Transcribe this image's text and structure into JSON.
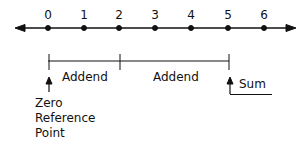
{
  "diagram": {
    "type": "number-line-addition",
    "ticks": [
      "0",
      "1",
      "2",
      "3",
      "4",
      "5",
      "6"
    ],
    "addend_1_label": "Addend",
    "addend_2_label": "Addend",
    "sum_label": "Sum",
    "zero_reference_lines": [
      "Zero",
      "Reference",
      "Point"
    ],
    "addend_1_range": [
      0,
      2
    ],
    "addend_2_range": [
      2,
      5
    ],
    "sum_value": 5
  }
}
